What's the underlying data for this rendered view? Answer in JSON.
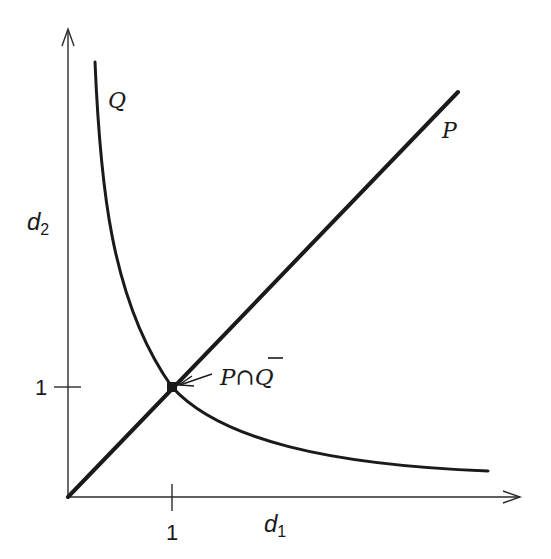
{
  "diagram": {
    "type": "coordinate-sketch",
    "axes": {
      "x_label": "d",
      "x_label_sub": "1",
      "y_label": "d",
      "y_label_sub": "2",
      "x_tick_label": "1",
      "y_tick_label": "1"
    },
    "curves": {
      "line_label": "P",
      "hyperbola_label": "Q",
      "intersection_label_left": "P",
      "intersection_label_cap": "∩",
      "intersection_label_right": "Q",
      "intersection_label_right_overbar": true
    },
    "colors": {
      "ink": "#1a1a1a",
      "background": "#ffffff"
    }
  }
}
